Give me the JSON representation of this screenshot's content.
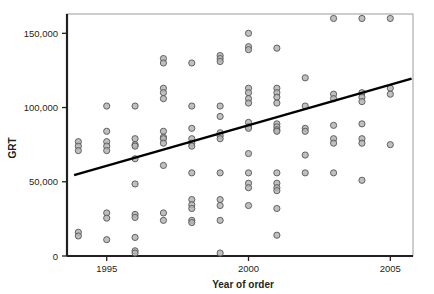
{
  "chart_data": {
    "type": "scatter",
    "title": "",
    "xlabel": "Year of order",
    "ylabel": "GRT",
    "xlim": [
      1993.6,
      2005.8
    ],
    "ylim": [
      0,
      163000
    ],
    "grid": false,
    "legend": null,
    "x_ticks": [
      1995,
      2000,
      2005
    ],
    "x_tick_labels": [
      "1995",
      "2000",
      "2005"
    ],
    "y_ticks": [
      0,
      50000,
      100000,
      150000
    ],
    "y_tick_labels": [
      "0",
      "50,000",
      "100,000",
      "150,000"
    ],
    "marker": {
      "shape": "circle",
      "fill": "#b5b5b5",
      "stroke": "#555555",
      "radius_px": 3.1
    },
    "trendline": {
      "label": "fitted regression line",
      "color": "#000000",
      "width_px": 2.4,
      "x_start": 1993.85,
      "y_start": 54500,
      "x_end": 2005.75,
      "y_end": 119500
    },
    "points": [
      [
        1994,
        77000
      ],
      [
        1994,
        74000
      ],
      [
        1994,
        71000
      ],
      [
        1994,
        16000
      ],
      [
        1994,
        13500
      ],
      [
        1995,
        101000
      ],
      [
        1995,
        84000
      ],
      [
        1995,
        77000
      ],
      [
        1995,
        74000
      ],
      [
        1995,
        71000
      ],
      [
        1995,
        29000
      ],
      [
        1995,
        25500
      ],
      [
        1995,
        11000
      ],
      [
        1996,
        101000
      ],
      [
        1996,
        79000
      ],
      [
        1996,
        75000
      ],
      [
        1996,
        74000
      ],
      [
        1996,
        65500
      ],
      [
        1996,
        48500
      ],
      [
        1996,
        28000
      ],
      [
        1996,
        26000
      ],
      [
        1996,
        12500
      ],
      [
        1996,
        3500
      ],
      [
        1996,
        2000
      ],
      [
        1997,
        133000
      ],
      [
        1997,
        130000
      ],
      [
        1997,
        113000
      ],
      [
        1997,
        110000
      ],
      [
        1997,
        106000
      ],
      [
        1997,
        84000
      ],
      [
        1997,
        80000
      ],
      [
        1997,
        79000
      ],
      [
        1997,
        76000
      ],
      [
        1997,
        61000
      ],
      [
        1997,
        29000
      ],
      [
        1997,
        24000
      ],
      [
        1998,
        130000
      ],
      [
        1998,
        101000
      ],
      [
        1998,
        86000
      ],
      [
        1998,
        79000
      ],
      [
        1998,
        76000
      ],
      [
        1998,
        74000
      ],
      [
        1998,
        56000
      ],
      [
        1998,
        38000
      ],
      [
        1998,
        34500
      ],
      [
        1998,
        32000
      ],
      [
        1998,
        24000
      ],
      [
        1998,
        22500
      ],
      [
        1999,
        135000
      ],
      [
        1999,
        133000
      ],
      [
        1999,
        131000
      ],
      [
        1999,
        101000
      ],
      [
        1999,
        94000
      ],
      [
        1999,
        83000
      ],
      [
        1999,
        81000
      ],
      [
        1999,
        79000
      ],
      [
        1999,
        56000
      ],
      [
        1999,
        38000
      ],
      [
        1999,
        34000
      ],
      [
        1999,
        24000
      ],
      [
        1999,
        2000
      ],
      [
        2000,
        150000
      ],
      [
        2000,
        141000
      ],
      [
        2000,
        139000
      ],
      [
        2000,
        113000
      ],
      [
        2000,
        110000
      ],
      [
        2000,
        106000
      ],
      [
        2000,
        103000
      ],
      [
        2000,
        90000
      ],
      [
        2000,
        87000
      ],
      [
        2000,
        86000
      ],
      [
        2000,
        69000
      ],
      [
        2000,
        56000
      ],
      [
        2000,
        49000
      ],
      [
        2000,
        46000
      ],
      [
        2000,
        34000
      ],
      [
        2001,
        140000
      ],
      [
        2001,
        113000
      ],
      [
        2001,
        110000
      ],
      [
        2001,
        107000
      ],
      [
        2001,
        103000
      ],
      [
        2001,
        89000
      ],
      [
        2001,
        87000
      ],
      [
        2001,
        85000
      ],
      [
        2001,
        84000
      ],
      [
        2001,
        56000
      ],
      [
        2001,
        49000
      ],
      [
        2001,
        46000
      ],
      [
        2001,
        44000
      ],
      [
        2001,
        32000
      ],
      [
        2001,
        14000
      ],
      [
        2002,
        120000
      ],
      [
        2002,
        101000
      ],
      [
        2002,
        86000
      ],
      [
        2002,
        84000
      ],
      [
        2002,
        68000
      ],
      [
        2002,
        56000
      ],
      [
        2003,
        160000
      ],
      [
        2003,
        109000
      ],
      [
        2003,
        106000
      ],
      [
        2003,
        88000
      ],
      [
        2003,
        79000
      ],
      [
        2003,
        76000
      ],
      [
        2003,
        56000
      ],
      [
        2004,
        160000
      ],
      [
        2004,
        110000
      ],
      [
        2004,
        107000
      ],
      [
        2004,
        104000
      ],
      [
        2004,
        89000
      ],
      [
        2004,
        79000
      ],
      [
        2004,
        76000
      ],
      [
        2004,
        51000
      ],
      [
        2005,
        160000
      ],
      [
        2005,
        113000
      ],
      [
        2005,
        109000
      ],
      [
        2005,
        75000
      ]
    ]
  }
}
